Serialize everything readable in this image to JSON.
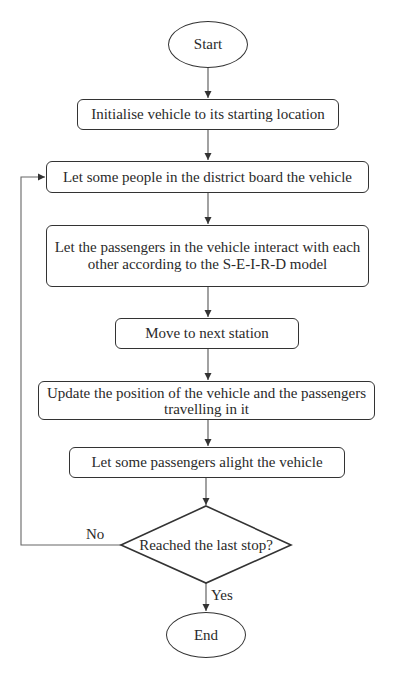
{
  "flowchart": {
    "nodes": {
      "start": {
        "type": "terminal",
        "label": "Start"
      },
      "initialise": {
        "type": "process",
        "label": "Initialise vehicle to its starting location"
      },
      "board": {
        "type": "process",
        "label": "Let some people in the district board the vehicle"
      },
      "interact": {
        "type": "process",
        "label": "Let the passengers in the vehicle interact with each other according to the S-E-I-R-D model"
      },
      "move": {
        "type": "process",
        "label": "Move to next station"
      },
      "update": {
        "type": "process",
        "label": "Update the position of the vehicle and the passengers travelling in it"
      },
      "alight": {
        "type": "process",
        "label": "Let some passengers alight the vehicle"
      },
      "decision": {
        "type": "decision",
        "label": "Reached the last stop?"
      },
      "end": {
        "type": "terminal",
        "label": "End"
      }
    },
    "edges": {
      "no_label": "No",
      "yes_label": "Yes"
    },
    "colors": {
      "stroke": "#333333",
      "text": "#2a2a2a",
      "background": "#ffffff"
    }
  }
}
